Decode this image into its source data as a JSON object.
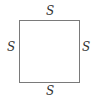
{
  "diagram": {
    "shape": "square",
    "stroke_color": "#7a7a7a",
    "label_color": "#333333",
    "labels": {
      "top": "S",
      "bottom": "S",
      "left": "S",
      "right": "S"
    }
  }
}
